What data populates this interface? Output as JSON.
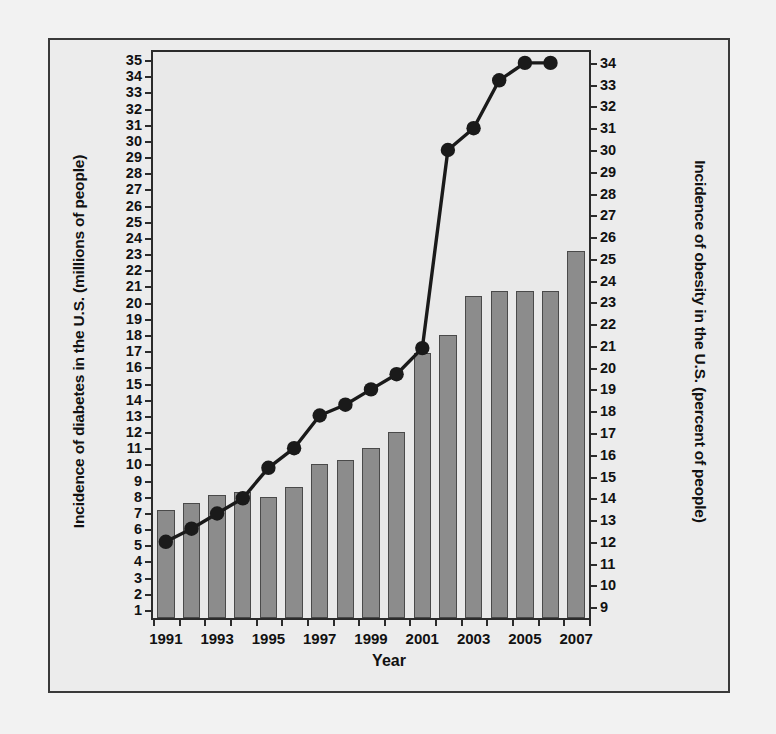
{
  "chart_data": {
    "type": "bar",
    "title": "",
    "xlabel": "Year",
    "ylabel": "Incidence of diabetes in the U.S. (millions of people)",
    "y2label": "Incidence of obesity in the U.S. (percent of people)",
    "categories": [
      1991,
      1992,
      1993,
      1994,
      1995,
      1996,
      1997,
      1998,
      1999,
      2000,
      2001,
      2002,
      2003,
      2004,
      2005,
      2006,
      2007
    ],
    "xtick_labels": [
      "1991",
      "1993",
      "1995",
      "1997",
      "1999",
      "2001",
      "2003",
      "2005",
      "2007"
    ],
    "xtick_values": [
      1991,
      1993,
      1995,
      1997,
      1999,
      2001,
      2003,
      2005,
      2007
    ],
    "ylim": [
      0.5,
      35.5
    ],
    "yticks": [
      1,
      2,
      3,
      4,
      5,
      6,
      7,
      8,
      9,
      10,
      11,
      12,
      13,
      14,
      15,
      16,
      17,
      18,
      19,
      20,
      21,
      22,
      23,
      24,
      25,
      26,
      27,
      28,
      29,
      30,
      31,
      32,
      33,
      34,
      35
    ],
    "y2lim": [
      8.5,
      34.5
    ],
    "y2ticks": [
      9,
      10,
      11,
      12,
      13,
      14,
      15,
      16,
      17,
      18,
      19,
      20,
      21,
      22,
      23,
      24,
      25,
      26,
      27,
      28,
      29,
      30,
      31,
      32,
      33,
      34
    ],
    "grid": false,
    "legend": "none",
    "series": [
      {
        "name": "Incidence of diabetes in the U.S. (millions of people)",
        "type": "bar",
        "axis": "left",
        "color": "#8c8c8c",
        "edge_color": "#4a4a4a",
        "values": [
          7.2,
          7.6,
          8.1,
          8.3,
          8.0,
          8.6,
          10.0,
          10.3,
          11.0,
          12.0,
          16.9,
          18.0,
          20.4,
          20.7,
          20.7,
          20.7,
          23.2
        ]
      },
      {
        "name": "Incidence of obesity in the U.S. (percent of people)",
        "type": "line",
        "axis": "right",
        "color": "#1a1a1a",
        "marker": "circle",
        "values": [
          12.0,
          12.6,
          13.3,
          14.0,
          15.4,
          16.3,
          17.8,
          18.3,
          19.0,
          19.7,
          20.9,
          30.0,
          31.0,
          33.2,
          34.0,
          34.0,
          null
        ]
      }
    ],
    "annotations": []
  }
}
